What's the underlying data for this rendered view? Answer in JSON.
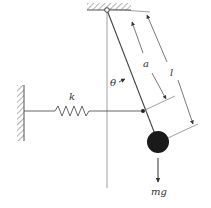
{
  "diagram": {
    "title": "",
    "labels": {
      "spring_constant": "k",
      "angle": "θ",
      "attachment_distance": "a",
      "pendulum_length": "l",
      "weight": "mg"
    },
    "colors": {
      "line": "#555555",
      "bob": "#1a1a1a",
      "background": "#ffffff"
    },
    "elements": [
      "left-wall",
      "ceiling",
      "pivot",
      "spring",
      "pendulum-rod",
      "bob",
      "vertical-reference",
      "dimension-a",
      "dimension-l",
      "weight-arrow"
    ]
  }
}
